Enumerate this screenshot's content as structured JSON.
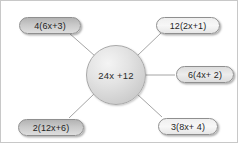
{
  "diagram": {
    "type": "hub-and-spoke",
    "title": "",
    "center": {
      "label": "24x +12",
      "shape": "circle",
      "fill": "#dcdcdc",
      "stroke": "#a9a9a9"
    },
    "nodes": [
      {
        "id": "node-top-left",
        "label": "4(6x+3)",
        "position": "top-left",
        "shape": "pill",
        "fill": "#c9c9c9"
      },
      {
        "id": "node-top-right",
        "label": "12(2x+1)",
        "position": "top-right",
        "shape": "pill",
        "fill": "#f2f2f2"
      },
      {
        "id": "node-right",
        "label": "6(4x+ 2)",
        "position": "right",
        "shape": "pill",
        "fill": "#e6e6e6"
      },
      {
        "id": "node-bottom-right",
        "label": "3(8x+ 4)",
        "position": "bottom-right",
        "shape": "pill",
        "fill": "#eaeaea"
      },
      {
        "id": "node-bottom-left",
        "label": "2(12x+6)",
        "position": "bottom-left",
        "shape": "pill",
        "fill": "#c9c9c9"
      }
    ],
    "edges": [
      {
        "from": "center",
        "to": "node-top-left"
      },
      {
        "from": "center",
        "to": "node-top-right"
      },
      {
        "from": "center",
        "to": "node-right"
      },
      {
        "from": "center",
        "to": "node-bottom-right"
      },
      {
        "from": "center",
        "to": "node-bottom-left"
      }
    ],
    "edge_color": "#9a9a9a",
    "frame_color": "#c8c8c8",
    "background": "#ffffff"
  }
}
